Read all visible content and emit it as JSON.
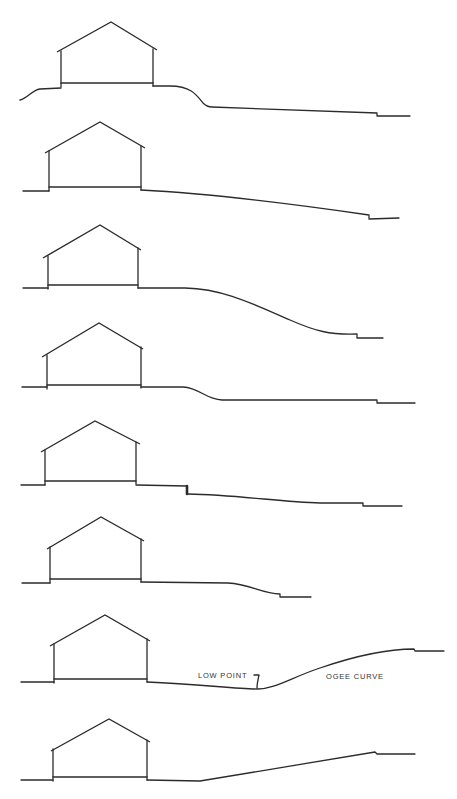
{
  "figure": {
    "stroke_color": "#2b2b2b",
    "background": "#ffffff"
  },
  "sections": [
    {
      "id": 1,
      "house": {
        "peak": [
          111,
          22
        ],
        "eave_l": [
          57,
          52
        ],
        "eave_r": [
          157,
          50
        ],
        "wall_l": 61,
        "wall_r": 153,
        "top_l": 51,
        "top_r": 49,
        "floor": 83
      },
      "ground_left": "M20,100 C28,98 32,90 40,89 L61,88",
      "ground_right": "M153,86 L170,86 C190,86 196,94 203,103 C206,106 209,107 212,107 L377,113 L377,116 L410,116"
    },
    {
      "id": 2,
      "house": {
        "peak": [
          100,
          122
        ],
        "eave_l": [
          45,
          153
        ],
        "eave_r": [
          145,
          148
        ],
        "wall_l": 49,
        "wall_r": 141,
        "top_l": 151,
        "top_r": 146,
        "floor": 187
      },
      "ground_left": "M23,191 L49,191",
      "ground_right": "M141,190 C220,194 300,205 369,215 L369,219 L399,218"
    },
    {
      "id": 3,
      "house": {
        "peak": [
          100,
          225
        ],
        "eave_l": [
          43,
          258
        ],
        "eave_r": [
          141,
          250
        ],
        "wall_l": 48,
        "wall_r": 138,
        "top_l": 256,
        "top_r": 248,
        "floor": 285
      },
      "ground_left": "M23,288 L48,288",
      "ground_right": "M138,288 L185,288 C225,289 255,305 290,320 C315,331 330,335 357,334 L357,338 L383,338"
    },
    {
      "id": 4,
      "house": {
        "peak": [
          99,
          323
        ],
        "eave_l": [
          42,
          357
        ],
        "eave_r": [
          143,
          349
        ],
        "wall_l": 47,
        "wall_r": 141,
        "top_l": 355,
        "top_r": 347,
        "floor": 385
      },
      "ground_left": "M22,387 L47,387",
      "ground_right": "M141,387 L183,387 C200,388 205,399 222,400 L377,400 L377,403 L415,403"
    },
    {
      "id": 5,
      "house": {
        "peak": [
          95,
          421
        ],
        "eave_l": [
          41,
          452
        ],
        "eave_r": [
          140,
          444
        ],
        "wall_l": 45,
        "wall_r": 136,
        "top_l": 450,
        "top_r": 442,
        "floor": 481
      },
      "ground_left": "M21,485 L45,485",
      "ground_right": "M136,485 L187,486",
      "step": "M187,486 L187,494",
      "ground_right_2": "M188,494 C240,495 280,502 320,503 L363,503 L363,506 L402,506"
    },
    {
      "id": 6,
      "house": {
        "peak": [
          101,
          517
        ],
        "eave_l": [
          47,
          549
        ],
        "eave_r": [
          144,
          541
        ],
        "wall_l": 50,
        "wall_r": 141,
        "top_l": 547,
        "top_r": 539,
        "floor": 579
      },
      "ground_left": "M22,583 L50,583",
      "ground_right": "M141,582 L228,583 C250,584 262,594 280,594 L280,597 L311,597"
    },
    {
      "id": 7,
      "house": {
        "peak": [
          105,
          615
        ],
        "eave_l": [
          50,
          646
        ],
        "eave_r": [
          150,
          641
        ],
        "wall_l": 54,
        "wall_r": 147,
        "top_l": 644,
        "top_r": 639,
        "floor": 679
      },
      "ground_left": "M21,682 L54,682",
      "ground_right": "M147,682 C200,684 235,689 258,689 C275,689 290,678 320,668 C355,656 385,649 414,649 L415,651 L444,651",
      "labels": [
        {
          "text": "LOW POINT",
          "x": 198,
          "y": 678
        },
        {
          "text": "OGEE CURVE",
          "x": 326,
          "y": 679
        }
      ],
      "arrow": "M254,675 L259,675 C258,680 257,684 257,688"
    },
    {
      "id": 8,
      "house": {
        "peak": [
          109,
          719
        ],
        "eave_l": [
          51,
          751
        ],
        "eave_r": [
          150,
          742
        ],
        "wall_l": 53,
        "wall_r": 147,
        "top_l": 749,
        "top_r": 740,
        "floor": 777
      },
      "ground_left": "M21,780 L53,780",
      "ground_right": "M147,780 L200,781 L375,752 L377,754 L415,754"
    }
  ],
  "annotations": {
    "low_point": "LOW POINT",
    "ogee_curve": "OGEE CURVE"
  }
}
